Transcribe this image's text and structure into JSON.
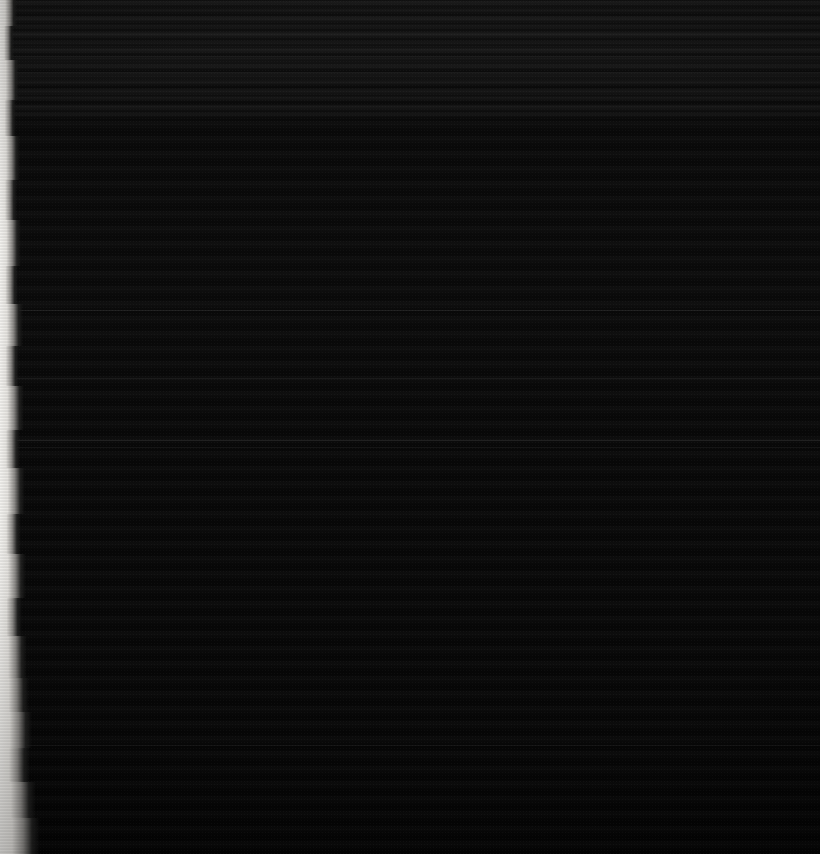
{
  "image": {
    "kind": "scanned-document-page",
    "title": "Underexposed scanned page",
    "width": 820,
    "height": 854,
    "legible_text": "",
    "notes": "No readable text, UI chrome, labels or numbers are visible in the pixels."
  },
  "colors": {
    "background": "#050505",
    "paper_dark": "#0b0b0b",
    "page_edge_light": "#f2f1ee",
    "page_edge_mid": "#9a9895",
    "rule": "#1a1a1a"
  },
  "regions": {
    "page_surface": {
      "name": "page-surface",
      "description": "Near-black printed page surface with faint horizontal text-line banding"
    },
    "top_band": {
      "name": "top-text-band",
      "description": "Denser horizontal striping across the upper portion of the sheet",
      "top": 0,
      "height": 120
    },
    "left_edge": {
      "name": "page-left-edge",
      "description": "Ragged light paper edge along the left margin, thin at top and widening toward the bottom"
    }
  },
  "rules": [
    {
      "name": "horizontal-rule-1",
      "y": 56,
      "opacity": "soft"
    },
    {
      "name": "horizontal-rule-2",
      "y": 72,
      "opacity": "soft"
    },
    {
      "name": "horizontal-rule-3",
      "y": 310,
      "opacity": "normal"
    },
    {
      "name": "horizontal-rule-4",
      "y": 378,
      "opacity": "soft"
    },
    {
      "name": "horizontal-rule-5",
      "y": 440,
      "opacity": "normal"
    },
    {
      "name": "horizontal-rule-6",
      "y": 447,
      "opacity": "soft"
    },
    {
      "name": "horizontal-rule-7",
      "y": 745,
      "opacity": "soft"
    }
  ],
  "edge_profile": [
    {
      "y": 0,
      "h": 26,
      "w": 7
    },
    {
      "y": 26,
      "h": 34,
      "w": 4
    },
    {
      "y": 60,
      "h": 40,
      "w": 9
    },
    {
      "y": 100,
      "h": 36,
      "w": 6
    },
    {
      "y": 136,
      "h": 44,
      "w": 10
    },
    {
      "y": 180,
      "h": 40,
      "w": 7
    },
    {
      "y": 220,
      "h": 46,
      "w": 11
    },
    {
      "y": 266,
      "h": 38,
      "w": 8
    },
    {
      "y": 304,
      "h": 42,
      "w": 13
    },
    {
      "y": 346,
      "h": 40,
      "w": 9
    },
    {
      "y": 386,
      "h": 44,
      "w": 14
    },
    {
      "y": 430,
      "h": 38,
      "w": 10
    },
    {
      "y": 468,
      "h": 46,
      "w": 15
    },
    {
      "y": 514,
      "h": 40,
      "w": 11
    },
    {
      "y": 554,
      "h": 44,
      "w": 16
    },
    {
      "y": 598,
      "h": 38,
      "w": 12
    },
    {
      "y": 636,
      "h": 42,
      "w": 17
    },
    {
      "y": 678,
      "h": 34,
      "w": 19
    },
    {
      "y": 712,
      "h": 36,
      "w": 22
    },
    {
      "y": 748,
      "h": 34,
      "w": 20
    },
    {
      "y": 782,
      "h": 36,
      "w": 26
    },
    {
      "y": 818,
      "h": 36,
      "w": 30
    }
  ]
}
